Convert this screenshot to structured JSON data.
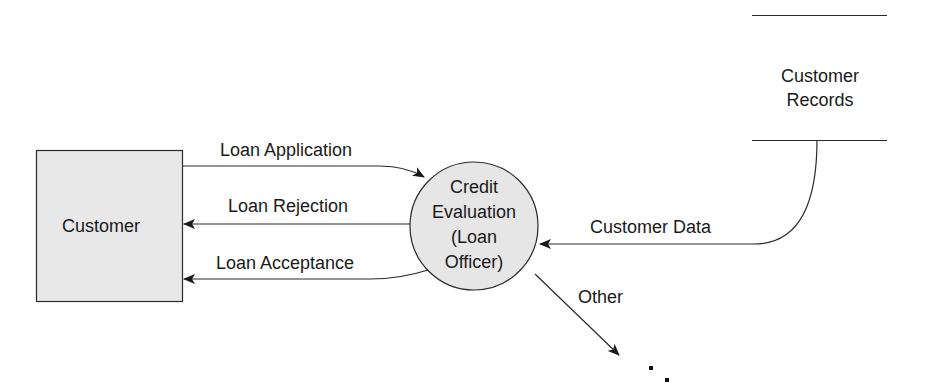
{
  "diagram": {
    "type": "data-flow-diagram",
    "external_entity": {
      "label": "Customer",
      "fill": "#e8e8e8"
    },
    "process": {
      "label_lines": [
        "Credit",
        "Evaluation",
        "(Loan",
        "Officer)"
      ],
      "fill": "#e6e6e6"
    },
    "data_store": {
      "label_lines": [
        "Customer",
        "Records"
      ]
    },
    "flows": [
      {
        "id": "loan-application",
        "label": "Loan Application",
        "from": "Customer",
        "to": "Credit Evaluation (Loan Officer)"
      },
      {
        "id": "loan-rejection",
        "label": "Loan Rejection",
        "from": "Credit Evaluation (Loan Officer)",
        "to": "Customer"
      },
      {
        "id": "loan-acceptance",
        "label": "Loan Acceptance",
        "from": "Credit Evaluation (Loan Officer)",
        "to": "Customer"
      },
      {
        "id": "customer-data",
        "label": "Customer Data",
        "from": "Customer Records",
        "to": "Credit Evaluation (Loan Officer)"
      },
      {
        "id": "other",
        "label": "Other",
        "from": "Credit Evaluation (Loan Officer)",
        "to": "…"
      }
    ],
    "continuation": "..",
    "line_color": "#222222"
  }
}
